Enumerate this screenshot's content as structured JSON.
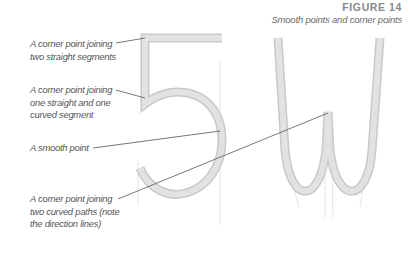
{
  "figure": {
    "title": "FIGURE 14",
    "subtitle": "Smooth points and corner points"
  },
  "glyphs": [
    "5",
    "W"
  ],
  "callouts": [
    {
      "line1": "A corner point joining",
      "line2": "two straight segments",
      "line3": ""
    },
    {
      "line1": "A corner point joining",
      "line2": "one straight and one",
      "line3": "curved segment"
    },
    {
      "line1": "A smooth point",
      "line2": "",
      "line3": ""
    },
    {
      "line1": "A corner point joining",
      "line2": "two curved paths (note",
      "line3": "the direction lines)"
    }
  ],
  "colors": {
    "stroke": "#dcdcdc",
    "stroke_edge": "#c8c8c8",
    "leader": "#555555",
    "text": "#555555",
    "title": "#8a8a8a"
  }
}
